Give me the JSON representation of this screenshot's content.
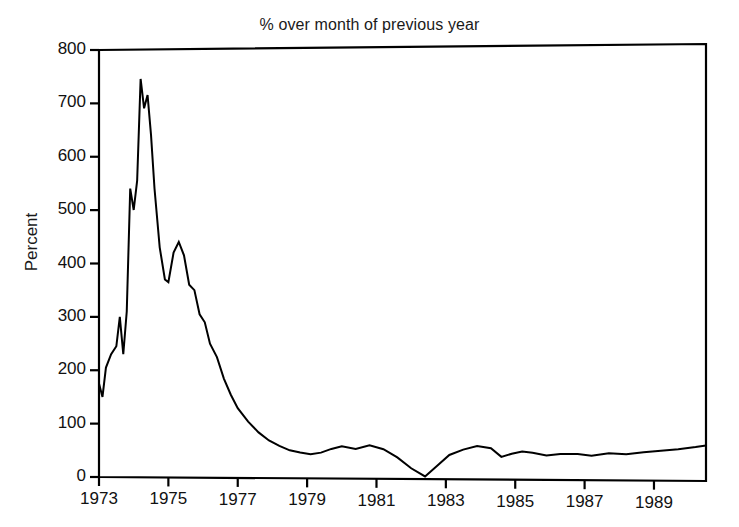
{
  "chart_data": {
    "type": "line",
    "title": "% over month of previous year",
    "xlabel": "",
    "ylabel": "Percent",
    "xlim": [
      1973.0,
      1990.5
    ],
    "ylim": [
      0,
      800
    ],
    "grid": false,
    "legend": null,
    "yticks": [
      0,
      100,
      200,
      300,
      400,
      500,
      600,
      700,
      800
    ],
    "ytick_labels": [
      "0",
      "100",
      "200",
      "300",
      "400",
      "500",
      "600",
      "700",
      "800"
    ],
    "xticks": [
      1973,
      1975,
      1977,
      1979,
      1981,
      1983,
      1985,
      1987,
      1989
    ],
    "xtick_labels": [
      "1973",
      "1975",
      "1977",
      "1979",
      "1981",
      "1983",
      "1985",
      "1987",
      "1989"
    ],
    "line_color": "#000000",
    "line_width": 2,
    "series": [
      {
        "name": "% over month of previous year",
        "x": [
          1973.0,
          1973.1,
          1973.2,
          1973.35,
          1973.5,
          1973.6,
          1973.7,
          1973.8,
          1973.9,
          1974.0,
          1974.1,
          1974.2,
          1974.3,
          1974.4,
          1974.5,
          1974.6,
          1974.75,
          1974.9,
          1975.0,
          1975.15,
          1975.3,
          1975.45,
          1975.6,
          1975.75,
          1975.9,
          1976.05,
          1976.2,
          1976.4,
          1976.6,
          1976.8,
          1977.0,
          1977.3,
          1977.6,
          1977.9,
          1978.2,
          1978.5,
          1978.8,
          1979.1,
          1979.4,
          1979.7,
          1980.0,
          1980.4,
          1980.8,
          1981.2,
          1981.6,
          1982.0,
          1982.4,
          1982.75,
          1983.1,
          1983.5,
          1983.9,
          1984.3,
          1984.6,
          1984.9,
          1985.2,
          1985.5,
          1985.9,
          1986.3,
          1986.8,
          1987.2,
          1987.7,
          1988.2,
          1988.7,
          1989.2,
          1989.7,
          1990.2,
          1990.5
        ],
        "y": [
          175,
          150,
          205,
          230,
          245,
          300,
          230,
          310,
          540,
          500,
          555,
          745,
          690,
          715,
          640,
          540,
          430,
          370,
          365,
          420,
          440,
          415,
          360,
          350,
          305,
          290,
          250,
          225,
          185,
          155,
          130,
          105,
          85,
          70,
          60,
          52,
          48,
          45,
          48,
          55,
          60,
          55,
          62,
          55,
          40,
          20,
          5,
          25,
          45,
          55,
          62,
          58,
          42,
          48,
          52,
          50,
          45,
          48,
          48,
          45,
          50,
          48,
          52,
          55,
          58,
          62,
          65
        ]
      }
    ]
  },
  "axes": {
    "frame_color": "#000000",
    "background": "#ffffff"
  }
}
